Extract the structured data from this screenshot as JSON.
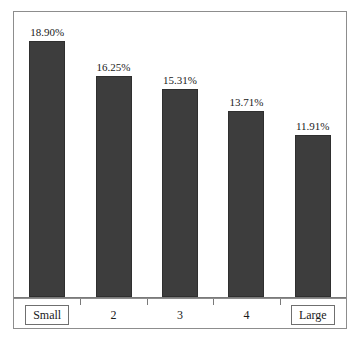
{
  "chart_data": {
    "type": "bar",
    "title": "",
    "subtitle": "",
    "xlabel": "",
    "ylabel": "",
    "grid": false,
    "legend": false,
    "legend_position": "none",
    "ylim": [
      0,
      21
    ],
    "axis_line": true,
    "categories": [
      "Small",
      "2",
      "3",
      "4",
      "Large"
    ],
    "values": [
      18.9,
      16.25,
      15.31,
      13.71,
      11.91
    ],
    "data_labels": [
      "18.90%",
      "16.25%",
      "15.31%",
      "13.71%",
      "11.91%"
    ],
    "bar_color": "#3d3d3d",
    "bar_edge_color": "#2f2f2f",
    "frame_color": "#8d8d8d",
    "text_color": "#1a1a1a",
    "bars": [
      {
        "category": "Small",
        "value": 18.9,
        "label": "18.90%",
        "boxed_category": true
      },
      {
        "category": "2",
        "value": 16.25,
        "label": "16.25%",
        "boxed_category": false
      },
      {
        "category": "3",
        "value": 15.31,
        "label": "15.31%",
        "boxed_category": false
      },
      {
        "category": "4",
        "value": 13.71,
        "label": "13.71%",
        "boxed_category": false
      },
      {
        "category": "Large",
        "value": 11.91,
        "label": "11.91%",
        "boxed_category": true
      }
    ]
  }
}
